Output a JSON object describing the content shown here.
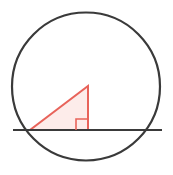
{
  "canvas": {
    "width": 173,
    "height": 175,
    "background": "#ffffff"
  },
  "figure": {
    "type": "geometry-diagram"
  },
  "colors": {
    "circle_stroke": "#3a3a3a",
    "line_stroke": "#3a3a3a",
    "triangle_stroke": "#e8635a",
    "triangle_fill": "#fdecea",
    "right_angle_stroke": "#e8635a",
    "background": "#ffffff"
  },
  "shapes": {
    "circle": {
      "name": "circle",
      "cx": 86,
      "cy": 86.5,
      "r": 74,
      "stroke_width": 2.2,
      "fill": "none"
    },
    "secant_line": {
      "name": "horizontal-line",
      "x1": 13,
      "y1": 130,
      "x2": 162,
      "y2": 130,
      "stroke_width": 2.2
    },
    "triangle": {
      "name": "right-triangle",
      "points": "30,130 88,130 88,86",
      "vertices": [
        {
          "label": "left-vertex",
          "x": 30,
          "y": 130
        },
        {
          "label": "right-angle-vertex",
          "x": 88,
          "y": 130
        },
        {
          "label": "apex",
          "x": 88,
          "y": 86
        }
      ],
      "stroke_width": 2.0
    },
    "right_angle_marker": {
      "name": "right-angle-marker",
      "points": "76,130 76,119 88,119",
      "size": 11,
      "stroke_width": 1.6,
      "fill": "none"
    }
  }
}
